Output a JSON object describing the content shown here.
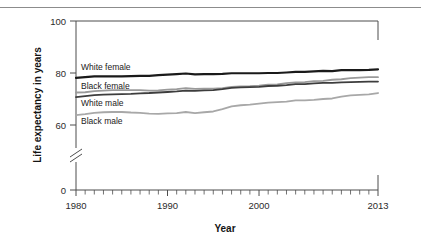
{
  "figure": {
    "top_rule_color": "#8c8c8c",
    "background": "#ffffff"
  },
  "chart_data": {
    "type": "line",
    "title": "",
    "xlabel": "Year",
    "ylabel": "Life expectancy in years",
    "xlim": [
      1980,
      2013
    ],
    "ylim": [
      0,
      100
    ],
    "y_axis_break": {
      "between": [
        0,
        60
      ],
      "present": true
    },
    "yticks": [
      0,
      60,
      80,
      100
    ],
    "ytick_labels": [
      "0",
      "60",
      "80",
      "100"
    ],
    "xticks": [
      1980,
      1990,
      2000,
      2013
    ],
    "xtick_labels": [
      "1980",
      "1990",
      "2000",
      "2013"
    ],
    "x_minor_tick_interval": 1,
    "grid": false,
    "legend": "inline-labels",
    "x": [
      1980,
      1981,
      1982,
      1983,
      1984,
      1985,
      1986,
      1987,
      1988,
      1989,
      1990,
      1991,
      1992,
      1993,
      1994,
      1995,
      1996,
      1997,
      1998,
      1999,
      2000,
      2001,
      2002,
      2003,
      2004,
      2005,
      2006,
      2007,
      2008,
      2009,
      2010,
      2011,
      2012,
      2013
    ],
    "series": [
      {
        "name": "White female",
        "color": "#1a1a1a",
        "width": 2.2,
        "label": "White female",
        "values": [
          78.1,
          78.4,
          78.7,
          78.7,
          78.7,
          78.7,
          78.8,
          78.9,
          78.9,
          79.2,
          79.4,
          79.6,
          79.8,
          79.5,
          79.6,
          79.6,
          79.7,
          79.9,
          79.9,
          79.9,
          79.9,
          80.0,
          80.0,
          80.2,
          80.4,
          80.4,
          80.6,
          80.8,
          80.7,
          81.1,
          81.1,
          81.1,
          81.2,
          81.4
        ]
      },
      {
        "name": "Black female",
        "color": "#9a9a9a",
        "width": 1.8,
        "label": "Black female",
        "values": [
          72.5,
          72.6,
          73.0,
          73.2,
          73.4,
          73.4,
          73.4,
          73.4,
          73.2,
          73.3,
          73.6,
          73.8,
          74.2,
          73.9,
          74.0,
          74.0,
          74.2,
          74.7,
          74.8,
          74.9,
          75.1,
          75.5,
          75.6,
          76.1,
          76.4,
          76.5,
          76.9,
          77.0,
          77.4,
          77.6,
          78.0,
          78.2,
          78.4,
          78.4
        ]
      },
      {
        "name": "White male",
        "color": "#3d3d3d",
        "width": 1.8,
        "label": "White male",
        "values": [
          70.7,
          71.1,
          71.5,
          71.7,
          71.8,
          71.9,
          72.0,
          72.2,
          72.3,
          72.5,
          72.7,
          72.9,
          73.2,
          73.1,
          73.3,
          73.4,
          73.8,
          74.3,
          74.5,
          74.6,
          74.7,
          75.0,
          75.1,
          75.3,
          75.7,
          75.7,
          76.0,
          76.2,
          76.2,
          76.4,
          76.5,
          76.6,
          76.7,
          76.7
        ]
      },
      {
        "name": "Black male",
        "color": "#a8a8a8",
        "width": 1.8,
        "label": "Black male",
        "values": [
          63.8,
          64.2,
          64.7,
          64.9,
          65.0,
          65.0,
          64.8,
          64.7,
          64.4,
          64.3,
          64.5,
          64.6,
          65.0,
          64.6,
          64.9,
          65.2,
          66.1,
          67.2,
          67.6,
          67.8,
          68.2,
          68.6,
          68.8,
          69.0,
          69.5,
          69.5,
          69.7,
          70.0,
          70.2,
          70.9,
          71.4,
          71.6,
          71.8,
          72.3
        ]
      }
    ]
  }
}
